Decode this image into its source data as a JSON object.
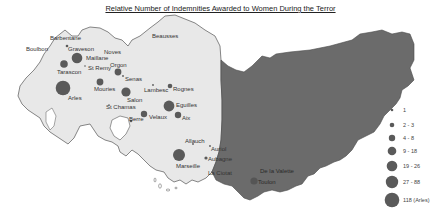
{
  "title": "Relative Number of Indemnities Awarded to Women During the Terror",
  "colors": {
    "region_light": "#e8e8e8",
    "region_dark": "#6b6b6b",
    "border": "#555555",
    "marker": "#5a5a5a"
  },
  "places": [
    {
      "name": "Barbentane",
      "marker": false
    },
    {
      "name": "Boulbon",
      "marker": false
    },
    {
      "name": "Graveson",
      "marker": "small"
    },
    {
      "name": "Noves",
      "marker": false
    },
    {
      "name": "Maillane",
      "marker": "large"
    },
    {
      "name": "Tarascon",
      "marker": "medium"
    },
    {
      "name": "St Remy",
      "marker": "dot"
    },
    {
      "name": "Orgon",
      "marker": "medium"
    },
    {
      "name": "Senas",
      "marker": "dot"
    },
    {
      "name": "Beausses",
      "marker": false
    },
    {
      "name": "Arles",
      "marker": "xlarge"
    },
    {
      "name": "Mouries",
      "marker": "medium"
    },
    {
      "name": "Salon",
      "marker": "large"
    },
    {
      "name": "Lambesc",
      "marker": "dot"
    },
    {
      "name": "Rognes",
      "marker": "small"
    },
    {
      "name": "St Chamas",
      "marker": "dot"
    },
    {
      "name": "Eguilles",
      "marker": "large"
    },
    {
      "name": "Velaux",
      "marker": "medium"
    },
    {
      "name": "Aix",
      "marker": "medium"
    },
    {
      "name": "Berre",
      "marker": "small"
    },
    {
      "name": "Allauch",
      "marker": "dot"
    },
    {
      "name": "Auriol",
      "marker": "dot"
    },
    {
      "name": "Marseille",
      "marker": "large"
    },
    {
      "name": "Aubagne",
      "marker": "small"
    },
    {
      "name": "La Ciotat",
      "marker": "dot"
    },
    {
      "name": "De la Valette",
      "marker": false
    },
    {
      "name": "Toulon",
      "marker": "medium"
    }
  ],
  "legend": {
    "items": [
      {
        "label": "1",
        "size": 1.3
      },
      {
        "label": "2 - 3",
        "size": 2.3
      },
      {
        "label": "4 - 8",
        "size": 3.2
      },
      {
        "label": "9 - 18",
        "size": 4.3
      },
      {
        "label": "19 - 26",
        "size": 5.3
      },
      {
        "label": "27 - 88",
        "size": 6.2
      },
      {
        "label": "118 (Arles)",
        "size": 7.3
      }
    ]
  }
}
